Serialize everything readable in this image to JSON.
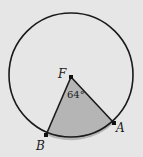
{
  "diagram": {
    "type": "circle-sector",
    "background": "#e6e6e6",
    "circle": {
      "cx": 71,
      "cy": 75,
      "r": 62,
      "stroke": "#1a1a1a"
    },
    "center_point": {
      "label": "F",
      "x": 71,
      "y": 77
    },
    "points": [
      {
        "label": "A",
        "x": 114,
        "y": 123
      },
      {
        "label": "B",
        "x": 46,
        "y": 135
      }
    ],
    "sector": {
      "fill": "#b5b5b5",
      "angle_label": "64°"
    }
  }
}
